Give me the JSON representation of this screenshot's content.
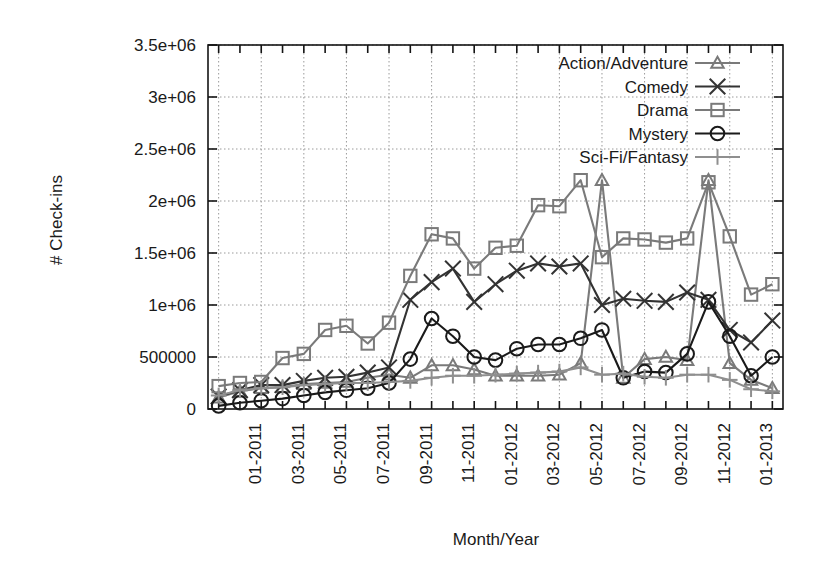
{
  "chart_data": {
    "type": "line",
    "title": "",
    "xlabel": "Month/Year",
    "ylabel": "# Check-ins",
    "grid": true,
    "legend_position": "top-right",
    "ylim": [
      0,
      3500000
    ],
    "ytick_labels": [
      "0",
      "500000",
      "1e+06",
      "1.5e+06",
      "2e+06",
      "2.5e+06",
      "3e+06",
      "3.5e+06"
    ],
    "ytick_values": [
      0,
      500000,
      1000000,
      1500000,
      2000000,
      2500000,
      3000000,
      3500000
    ],
    "xtick_labels": [
      "01-2011",
      "03-2011",
      "05-2011",
      "07-2011",
      "09-2011",
      "11-2011",
      "01-2012",
      "03-2012",
      "05-2012",
      "07-2012",
      "09-2012",
      "11-2012",
      "01-2013"
    ],
    "x": [
      "11-2010",
      "12-2010",
      "01-2011",
      "02-2011",
      "03-2011",
      "04-2011",
      "05-2011",
      "06-2011",
      "07-2011",
      "08-2011",
      "09-2011",
      "10-2011",
      "11-2011",
      "12-2011",
      "01-2012",
      "02-2012",
      "03-2012",
      "04-2012",
      "05-2012",
      "06-2012",
      "07-2012",
      "08-2012",
      "09-2012",
      "10-2012",
      "11-2012",
      "12-2012",
      "01-2013"
    ],
    "categories": [
      "11-2010",
      "12-2010",
      "01-2011",
      "02-2011",
      "03-2011",
      "04-2011",
      "05-2011",
      "06-2011",
      "07-2011",
      "08-2011",
      "09-2011",
      "10-2011",
      "11-2011",
      "12-2011",
      "01-2012",
      "02-2012",
      "03-2012",
      "04-2012",
      "05-2012",
      "06-2012",
      "07-2012",
      "08-2012",
      "09-2012",
      "10-2012",
      "11-2012",
      "12-2012",
      "01-2013"
    ],
    "series": [
      {
        "name": "Action/Adventure",
        "marker": "triangle",
        "color": "#7a7a7a",
        "values": [
          110000,
          170000,
          200000,
          210000,
          240000,
          250000,
          260000,
          300000,
          330000,
          300000,
          420000,
          420000,
          380000,
          320000,
          320000,
          320000,
          330000,
          440000,
          2200000,
          300000,
          480000,
          500000,
          470000,
          2200000,
          440000,
          280000,
          200000
        ]
      },
      {
        "name": "Comedy",
        "marker": "cross",
        "color": "#333333",
        "values": [
          120000,
          180000,
          230000,
          230000,
          270000,
          300000,
          310000,
          350000,
          400000,
          1050000,
          1220000,
          1350000,
          1030000,
          1200000,
          1330000,
          1400000,
          1370000,
          1400000,
          1000000,
          1060000,
          1040000,
          1030000,
          1120000,
          1050000,
          760000,
          640000,
          850000
        ]
      },
      {
        "name": "Drama",
        "marker": "square",
        "color": "#7a7a7a",
        "values": [
          220000,
          250000,
          260000,
          490000,
          530000,
          760000,
          800000,
          630000,
          830000,
          1280000,
          1680000,
          1640000,
          1350000,
          1550000,
          1570000,
          1960000,
          1950000,
          2200000,
          1460000,
          1640000,
          1630000,
          1600000,
          1640000,
          2180000,
          1660000,
          1100000,
          1200000
        ]
      },
      {
        "name": "Mystery",
        "marker": "circle",
        "color": "#1a1a1a",
        "values": [
          30000,
          60000,
          80000,
          100000,
          130000,
          160000,
          180000,
          200000,
          250000,
          480000,
          870000,
          700000,
          500000,
          470000,
          580000,
          620000,
          620000,
          680000,
          760000,
          300000,
          360000,
          350000,
          530000,
          1030000,
          700000,
          320000,
          500000
        ]
      },
      {
        "name": "Sci-Fi/Fantasy",
        "marker": "plus",
        "color": "#8f8f8f",
        "values": [
          130000,
          180000,
          200000,
          210000,
          230000,
          240000,
          250000,
          250000,
          260000,
          270000,
          300000,
          320000,
          320000,
          330000,
          340000,
          350000,
          360000,
          400000,
          330000,
          340000,
          310000,
          300000,
          330000,
          330000,
          280000,
          190000,
          170000
        ]
      }
    ]
  },
  "legend": {
    "items": [
      {
        "label": "Action/Adventure",
        "marker": "triangle-icon"
      },
      {
        "label": "Comedy",
        "marker": "cross-icon"
      },
      {
        "label": "Drama",
        "marker": "square-icon"
      },
      {
        "label": "Mystery",
        "marker": "circle-icon"
      },
      {
        "label": "Sci-Fi/Fantasy",
        "marker": "plus-icon"
      }
    ]
  },
  "colors": {
    "gray": "#7a7a7a",
    "dark": "#1a1a1a",
    "lightgray": "#8f8f8f",
    "frame": "#141414",
    "grid": "#9a9a9a"
  }
}
